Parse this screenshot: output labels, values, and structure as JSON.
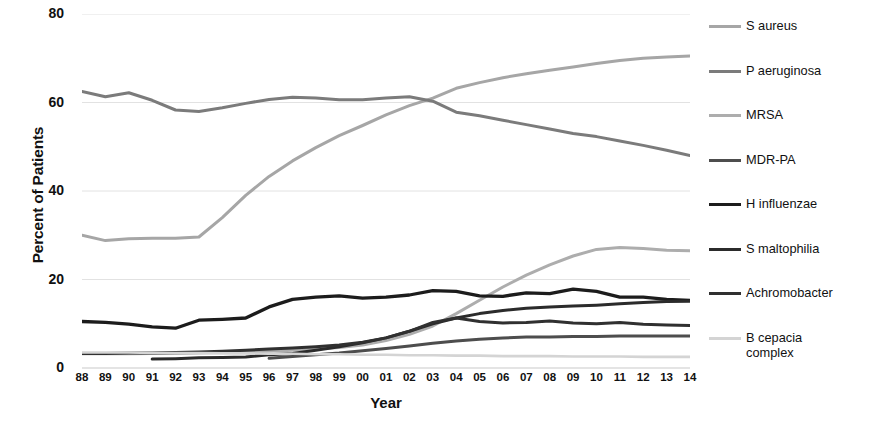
{
  "chart_data": {
    "type": "line",
    "title": "",
    "xlabel": "Year",
    "ylabel": "Percent of Patients",
    "xlim": [
      1988,
      2014
    ],
    "ylim": [
      0,
      80
    ],
    "yticks": [
      0,
      20,
      40,
      60,
      80
    ],
    "ytick_labels": [
      "0",
      "20",
      "40",
      "60",
      "80"
    ],
    "grid": "horizontal",
    "legend_position": "right",
    "x": [
      1988,
      1989,
      1990,
      1991,
      1992,
      1993,
      1994,
      1995,
      1996,
      1997,
      1998,
      1999,
      2000,
      2001,
      2002,
      2003,
      2004,
      2005,
      2006,
      2007,
      2008,
      2009,
      2010,
      2011,
      2012,
      2013,
      2014
    ],
    "xtick_labels": [
      "88",
      "89",
      "90",
      "91",
      "92",
      "93",
      "94",
      "95",
      "96",
      "97",
      "98",
      "99",
      "00",
      "01",
      "02",
      "03",
      "04",
      "05",
      "06",
      "07",
      "08",
      "09",
      "10",
      "11",
      "12",
      "13",
      "14"
    ],
    "series": [
      {
        "name": "S aureus",
        "color": "#a6a6a6",
        "width": 3.0,
        "values": [
          30.0,
          28.8,
          29.2,
          29.3,
          29.3,
          29.6,
          34.0,
          39.0,
          43.3,
          46.8,
          49.8,
          52.5,
          54.8,
          57.2,
          59.3,
          61.0,
          63.2,
          64.5,
          65.6,
          66.5,
          67.3,
          68.0,
          68.8,
          69.5,
          70.0,
          70.3,
          70.5
        ]
      },
      {
        "name": "P aeruginosa",
        "color": "#7b7b7b",
        "width": 3.0,
        "values": [
          62.5,
          61.3,
          62.2,
          60.5,
          58.3,
          58.0,
          58.8,
          59.8,
          60.7,
          61.2,
          61.0,
          60.6,
          60.6,
          61.0,
          61.3,
          60.3,
          57.8,
          57.0,
          56.0,
          55.0,
          54.0,
          53.0,
          52.3,
          51.3,
          50.3,
          49.2,
          48.0
        ]
      },
      {
        "name": "MRSA",
        "color": "#adadad",
        "width": 3.0,
        "values": [
          3.2,
          3.2,
          3.2,
          3.3,
          3.3,
          3.4,
          3.5,
          3.6,
          3.8,
          4.0,
          4.3,
          4.6,
          5.2,
          6.2,
          7.6,
          9.5,
          12.3,
          15.3,
          18.3,
          21.0,
          23.3,
          25.3,
          26.8,
          27.2,
          27.0,
          26.6,
          26.5
        ]
      },
      {
        "name": "MDR-PA",
        "color": "#4d4d4d",
        "width": 3.0,
        "values": [
          null,
          null,
          null,
          null,
          null,
          null,
          null,
          null,
          2.2,
          2.6,
          3.0,
          3.4,
          3.9,
          4.4,
          5.0,
          5.6,
          6.1,
          6.5,
          6.8,
          7.0,
          7.0,
          7.1,
          7.1,
          7.2,
          7.2,
          7.2,
          7.2
        ]
      },
      {
        "name": "H influenzae",
        "color": "#1c1c1c",
        "width": 3.3,
        "values": [
          10.5,
          10.3,
          9.9,
          9.3,
          9.0,
          10.8,
          11.0,
          11.3,
          13.8,
          15.5,
          16.0,
          16.3,
          15.8,
          16.0,
          16.5,
          17.5,
          17.3,
          16.3,
          16.2,
          17.0,
          16.8,
          17.8,
          17.3,
          16.0,
          16.0,
          15.5,
          15.3
        ]
      },
      {
        "name": "S maltophilia",
        "color": "#2b2b2b",
        "width": 3.0,
        "values": [
          null,
          null,
          null,
          2.0,
          2.1,
          2.3,
          2.4,
          2.5,
          3.0,
          3.3,
          4.0,
          4.8,
          5.7,
          6.8,
          8.3,
          10.0,
          11.3,
          12.3,
          13.0,
          13.5,
          13.8,
          14.0,
          14.2,
          14.5,
          14.8,
          15.0,
          15.1
        ]
      },
      {
        "name": "Achromobacter",
        "color": "#303030",
        "width": 3.0,
        "values": [
          3.3,
          3.3,
          3.4,
          3.4,
          3.5,
          3.6,
          3.8,
          4.0,
          4.3,
          4.5,
          4.8,
          5.2,
          5.8,
          6.8,
          8.3,
          10.3,
          11.3,
          10.5,
          10.2,
          10.3,
          10.6,
          10.2,
          10.0,
          10.3,
          9.9,
          9.7,
          9.6
        ]
      },
      {
        "name": "B cepacia complex",
        "color": "#d4d4d4",
        "width": 2.6,
        "values": [
          3.5,
          3.5,
          3.5,
          3.4,
          3.4,
          3.4,
          3.3,
          3.3,
          3.2,
          3.2,
          3.1,
          3.1,
          3.0,
          3.0,
          2.9,
          2.9,
          2.8,
          2.8,
          2.7,
          2.7,
          2.7,
          2.6,
          2.6,
          2.6,
          2.5,
          2.5,
          2.5
        ]
      }
    ]
  },
  "legend": {
    "items": [
      {
        "label": "S aureus",
        "color": "#a6a6a6"
      },
      {
        "label": "P aeruginosa",
        "color": "#7b7b7b"
      },
      {
        "label": "MRSA",
        "color": "#adadad"
      },
      {
        "label": "MDR-PA",
        "color": "#4d4d4d"
      },
      {
        "label": "H influenzae",
        "color": "#1c1c1c"
      },
      {
        "label": "S maltophilia",
        "color": "#2b2b2b"
      },
      {
        "label": "Achromobacter",
        "color": "#303030"
      },
      {
        "label": "B cepacia\ncomplex",
        "color": "#d4d4d4"
      }
    ]
  }
}
